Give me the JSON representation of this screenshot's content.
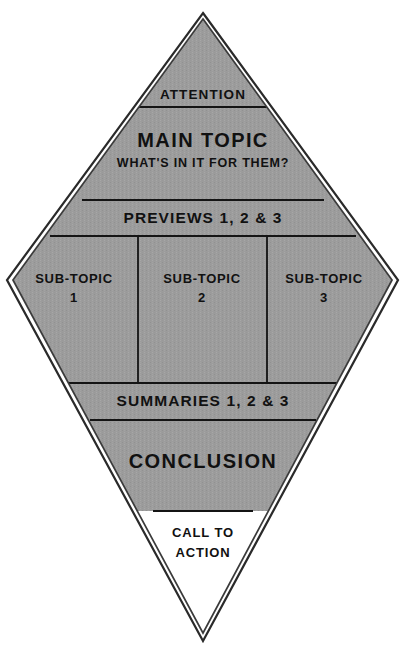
{
  "diagram": {
    "shape": "diamond",
    "fill_color": "#9c9c9c",
    "outline_color": "#1a1a1a",
    "inner_outline_color": "#2b2b2b",
    "divider_color": "#141414",
    "unfilled_color": "#ffffff",
    "sections": [
      {
        "id": "attention",
        "label": "ATTENTION",
        "filled": true
      },
      {
        "id": "main-topic",
        "label": "MAIN TOPIC",
        "sublabel": "WHAT'S IN IT FOR THEM?",
        "filled": true
      },
      {
        "id": "previews",
        "label": "PREVIEWS 1, 2 & 3",
        "filled": true
      },
      {
        "id": "sub-topic-1",
        "label": "SUB-TOPIC",
        "number": "1",
        "filled": true
      },
      {
        "id": "sub-topic-2",
        "label": "SUB-TOPIC",
        "number": "2",
        "filled": true
      },
      {
        "id": "sub-topic-3",
        "label": "SUB-TOPIC",
        "number": "3",
        "filled": true
      },
      {
        "id": "summaries",
        "label": "SUMMARIES 1, 2 & 3",
        "filled": true
      },
      {
        "id": "conclusion",
        "label": "CONCLUSION",
        "filled": true
      },
      {
        "id": "call-to-action",
        "label_line_1": "CALL TO",
        "label_line_2": "ACTION",
        "filled": false
      }
    ]
  }
}
